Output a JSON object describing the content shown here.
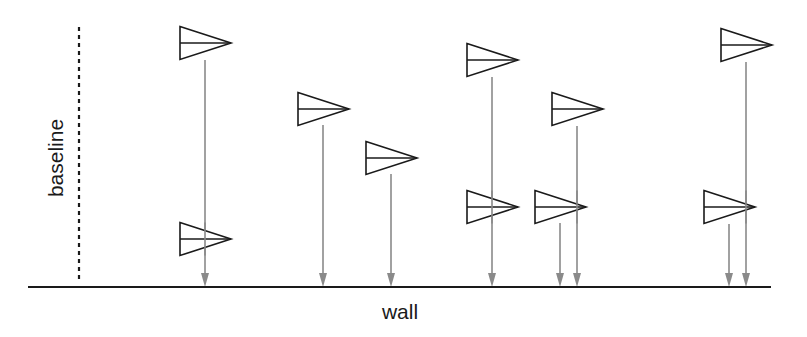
{
  "diagram": {
    "title": "",
    "labels": {
      "baseline": "baseline",
      "wall": "wall"
    },
    "colors": {
      "outline": "#1a1a1a",
      "wall": "#1a1a1a",
      "baseline": "#1a1a1a",
      "arrow": "#8a8a8a",
      "fill": "#ffffff"
    },
    "wall": {
      "x1": 28,
      "x2": 771,
      "y": 287,
      "stroke_width": 2.2
    },
    "baseline": {
      "x": 79,
      "y1": 27,
      "y2": 283,
      "dash": "4 4",
      "stroke_width": 2.2
    },
    "flag_size": {
      "width": 51,
      "height": 33
    },
    "flags": [
      {
        "id": "flag-1",
        "left": 180,
        "center_y": 43,
        "stem_x": 205
      },
      {
        "id": "flag-2",
        "left": 180,
        "center_y": 239,
        "stem_x": 205
      },
      {
        "id": "flag-3",
        "left": 298,
        "center_y": 109,
        "stem_x": 323
      },
      {
        "id": "flag-4",
        "left": 366,
        "center_y": 158,
        "stem_x": 391
      },
      {
        "id": "flag-5",
        "left": 467,
        "center_y": 60,
        "stem_x": 492
      },
      {
        "id": "flag-6",
        "left": 467,
        "center_y": 207,
        "stem_x": 492
      },
      {
        "id": "flag-7",
        "left": 535,
        "center_y": 207,
        "stem_x": 560
      },
      {
        "id": "flag-8",
        "left": 552,
        "center_y": 109,
        "stem_x": 577
      },
      {
        "id": "flag-9",
        "left": 721,
        "center_y": 45,
        "stem_x": 746
      },
      {
        "id": "flag-10",
        "left": 704,
        "center_y": 207,
        "stem_x": 729
      }
    ],
    "arrows": [
      {
        "id": "arrow-1",
        "x": 205,
        "from_flag": "flag-1",
        "y_start": 60
      },
      {
        "id": "arrow-2",
        "x": 323,
        "from_flag": "flag-3",
        "y_start": 125
      },
      {
        "id": "arrow-3",
        "x": 391,
        "from_flag": "flag-4",
        "y_start": 174
      },
      {
        "id": "arrow-4",
        "x": 492,
        "from_flag": "flag-5",
        "y_start": 77
      },
      {
        "id": "arrow-5",
        "x": 560,
        "from_flag": "flag-7",
        "y_start": 223
      },
      {
        "id": "arrow-6",
        "x": 577,
        "from_flag": "flag-8",
        "y_start": 126
      },
      {
        "id": "arrow-7",
        "x": 729,
        "from_flag": "flag-10",
        "y_start": 224
      },
      {
        "id": "arrow-8",
        "x": 746,
        "from_flag": "flag-9",
        "y_start": 62
      }
    ],
    "arrow_head": {
      "width": 8,
      "length": 14
    }
  }
}
